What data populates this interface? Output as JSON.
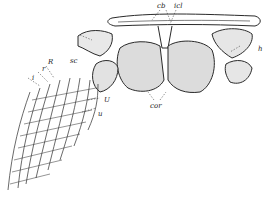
{
  "figure": {
    "labels": {
      "cb": "cb",
      "icl": "icl",
      "sc": "sc",
      "h": "h",
      "R": "R",
      "r": "r",
      "i": "i",
      "U": "U",
      "u": "u",
      "cor": "cor"
    }
  }
}
